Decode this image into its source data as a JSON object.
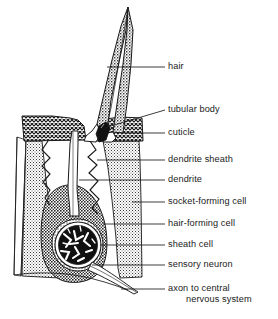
{
  "diagram": {
    "style": {
      "line_color": "#111111",
      "background": "#ffffff",
      "cuticle_fill": "cross-hatch-50",
      "socket_cell_fill": "stipple-light",
      "hair_cell_fill": "stipple-dark",
      "hair_fill": "stipple-medium",
      "neuron_fill": "dark-branching"
    },
    "parts": [
      {
        "id": "hair",
        "name": "hair-shaft"
      },
      {
        "id": "tubular-body",
        "name": "tubular-body"
      },
      {
        "id": "cuticle",
        "name": "cuticle-block"
      },
      {
        "id": "dendrite-sheath",
        "name": "dendrite-sheath"
      },
      {
        "id": "dendrite",
        "name": "dendrite-tube"
      },
      {
        "id": "socket-forming-cell",
        "name": "socket-forming-cell"
      },
      {
        "id": "hair-forming-cell",
        "name": "hair-forming-cell"
      },
      {
        "id": "sheath-cell",
        "name": "sheath-cell"
      },
      {
        "id": "sensory-neuron",
        "name": "sensory-neuron-soma"
      },
      {
        "id": "axon",
        "name": "axon-fiber"
      }
    ]
  },
  "labels": {
    "hair": "hair",
    "tubular_body": "tubular body",
    "cuticle": "cuticle",
    "dendrite_sheath": "dendrite sheath",
    "dendrite": "dendrite",
    "socket_forming_cell": "socket-forming cell",
    "hair_forming_cell": "hair-forming cell",
    "sheath_cell": "sheath cell",
    "sensory_neuron": "sensory neuron",
    "axon_line1": "axon to central",
    "axon_line2": "nervous system"
  }
}
